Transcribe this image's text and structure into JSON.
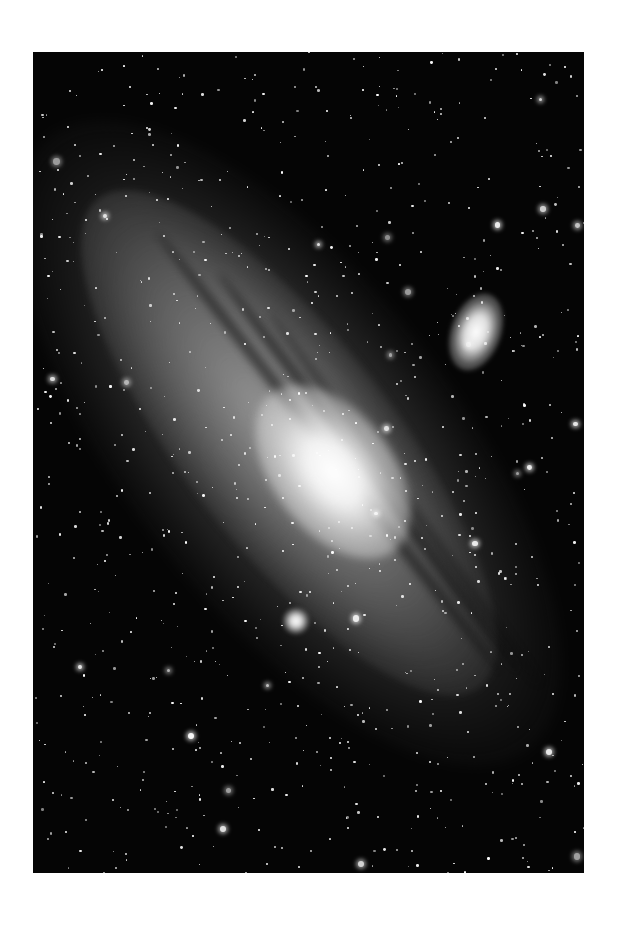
{
  "image": {
    "subject": "Andromeda galaxy (spiral galaxy) with satellite galaxies, grayscale astrophotograph",
    "palette": {
      "background": "#ffffff",
      "sky": "#050505",
      "core": "#ffffff",
      "disk": "#969696",
      "dust": "#0a0a0a"
    }
  }
}
